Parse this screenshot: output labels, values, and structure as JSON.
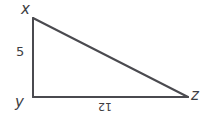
{
  "diagram": {
    "type": "right-triangle",
    "background_color": "#ffffff",
    "stroke_color": "#4a4a4f",
    "label_color": "#3d3d42",
    "vertices": [
      {
        "id": "x",
        "label": "x",
        "position": "top-left"
      },
      {
        "id": "y",
        "label": "y",
        "position": "bottom-left"
      },
      {
        "id": "z",
        "label": "z",
        "position": "bottom-right"
      }
    ],
    "sides": [
      {
        "id": "xy",
        "label": "5",
        "orientation": "vertical",
        "from": "x",
        "to": "y"
      },
      {
        "id": "yz",
        "label": "12",
        "orientation": "horizontal",
        "from": "y",
        "to": "z"
      },
      {
        "id": "xz",
        "label": "",
        "orientation": "hypotenuse",
        "from": "x",
        "to": "z"
      }
    ],
    "geometry": {
      "x_point": [
        33,
        18
      ],
      "y_point": [
        33,
        97
      ],
      "z_point": [
        188,
        97
      ],
      "stroke_width": 2
    }
  }
}
